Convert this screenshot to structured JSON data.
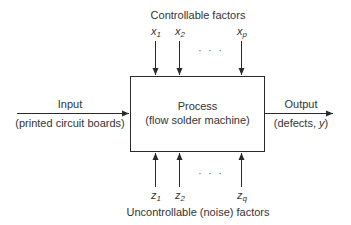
{
  "diagram": {
    "type": "process-model",
    "top_label": "Controllable factors",
    "bottom_label": "Uncontrollable (noise) factors",
    "controllable_factors": [
      {
        "var": "x",
        "sub": "1"
      },
      {
        "var": "x",
        "sub": "2"
      },
      {
        "var": "x",
        "sub": "p"
      }
    ],
    "noise_factors": [
      {
        "var": "z",
        "sub": "1"
      },
      {
        "var": "z",
        "sub": "2"
      },
      {
        "var": "z",
        "sub": "q"
      }
    ],
    "ellipsis": "· · ·",
    "process": {
      "title": "Process",
      "subtitle": "(flow solder machine)"
    },
    "input": {
      "label": "Input",
      "detail": "(printed circuit boards)"
    },
    "output": {
      "label": "Output",
      "detail_prefix": "(defects, ",
      "detail_var": "y",
      "detail_suffix": ")"
    },
    "colors": {
      "line": "#2a2a2a",
      "text": "#333333",
      "background": "#ffffff"
    }
  }
}
